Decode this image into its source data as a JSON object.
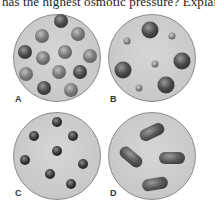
{
  "question": {
    "text": "has the highest osmotic pressure? Explain."
  },
  "panels": [
    {
      "id": "A",
      "label": "A",
      "description": "Twelve medium shaded spheres"
    },
    {
      "id": "B",
      "label": "B",
      "description": "Four large and four small spheres"
    },
    {
      "id": "C",
      "label": "C",
      "description": "Eight small dark spheres"
    },
    {
      "id": "D",
      "label": "D",
      "description": "Four elongated oval particles"
    }
  ]
}
